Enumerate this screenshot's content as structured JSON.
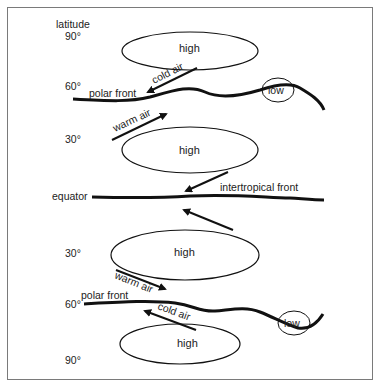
{
  "diagram": {
    "axis_title": "latitude",
    "latitudes": {
      "north_90": "90°",
      "north_60": "60°",
      "north_30": "30°",
      "equator": "equator",
      "south_30": "30°",
      "south_60": "60°",
      "south_90": "90°"
    },
    "pressure": {
      "high_north_polar": "high",
      "high_north_subtropic": "high",
      "high_south_subtropic": "high",
      "high_south_polar": "high",
      "low_north": "low",
      "low_south": "low"
    },
    "fronts": {
      "north_polar": "polar front",
      "intertropical": "intertropical front",
      "south_polar": "polar front"
    },
    "airflows": {
      "north_cold": "cold air",
      "north_warm": "warm air",
      "south_warm": "warm air",
      "south_cold": "cold air"
    }
  }
}
